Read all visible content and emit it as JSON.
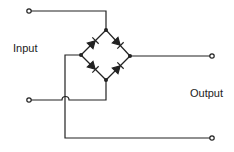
{
  "diagram": {
    "type": "bridge-rectifier",
    "labels": {
      "input": "Input",
      "output": "Output"
    },
    "components": [
      {
        "name": "diode-top-left",
        "type": "diode"
      },
      {
        "name": "diode-top-right",
        "type": "diode"
      },
      {
        "name": "diode-bottom-left",
        "type": "diode"
      },
      {
        "name": "diode-bottom-right",
        "type": "diode"
      }
    ],
    "terminals": [
      "input-top",
      "input-bottom",
      "output-top",
      "output-bottom"
    ],
    "colors": {
      "line": "#222222",
      "background": "#ffffff"
    }
  }
}
